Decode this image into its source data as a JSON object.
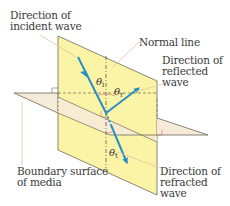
{
  "labels": {
    "incident_line1": "Direction of",
    "incident_line2": "incident wave",
    "normal": "Normal line",
    "reflected_line1": "Direction of",
    "reflected_line2": "reflected",
    "reflected_line3": "wave",
    "boundary_line1": "Boundary surface",
    "boundary_line2": "of media",
    "refracted_line1": "Direction of",
    "refracted_line2": "refracted",
    "refracted_line3": "wave"
  },
  "angles": {
    "incident_symbol": "θ",
    "incident_sub": "i",
    "reflected_symbol": "θ",
    "reflected_sub": "r",
    "refracted_symbol": "θ",
    "refracted_sub": "t"
  },
  "colors": {
    "plane_of_incidence": "#fbf3a6",
    "boundary_surface": "#f6ead8",
    "ray": "#2a8fc0",
    "edge": "#6b6b5a",
    "leader": "#e3c79a",
    "text": "#3a3a3a"
  }
}
